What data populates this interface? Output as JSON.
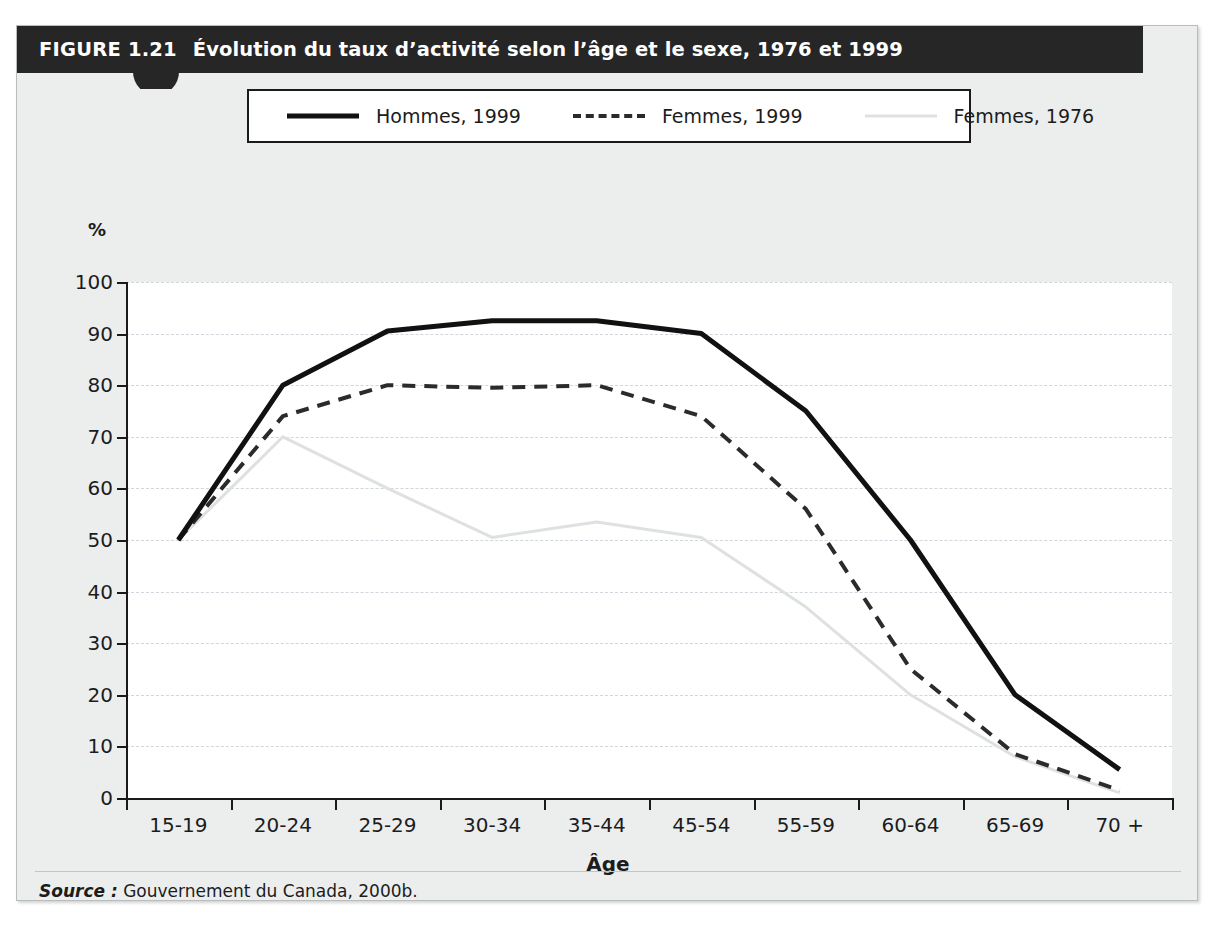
{
  "figure": {
    "number": "FIGURE 1.21",
    "title": "Évolution du taux d’activité selon l’âge et le sexe, 1976 et 1999",
    "source_label": "Source :",
    "source_text": "Gouvernement du Canada, 2000b.",
    "header_color": "#262626",
    "plate_color": "#eceeee"
  },
  "chart_data": {
    "type": "line",
    "title": "Évolution du taux d’activité selon l’âge et le sexe, 1976 et 1999",
    "xlabel": "Âge",
    "ylabel": "%",
    "ylim": [
      0,
      100
    ],
    "ytick_step": 10,
    "yticks": [
      "100",
      "90",
      "80",
      "70",
      "60",
      "50",
      "40",
      "30",
      "20",
      "10",
      "0"
    ],
    "grid": true,
    "legend_position": "top-center",
    "categories": [
      "15-19",
      "20-24",
      "25-29",
      "30-34",
      "35-44",
      "45-54",
      "55-59",
      "60-64",
      "65-69",
      "70 +"
    ],
    "series": [
      {
        "name": "Hommes, 1999",
        "style": "solid",
        "color": "#111111",
        "values": [
          50,
          80,
          90.5,
          92.5,
          92.5,
          90,
          75,
          50,
          20,
          5.5
        ]
      },
      {
        "name": "Femmes, 1999",
        "style": "dashed",
        "color": "#2b2b2b",
        "values": [
          50,
          74,
          80,
          79.5,
          80,
          74,
          56,
          25,
          8.5,
          1.5
        ]
      },
      {
        "name": "Femmes, 1976",
        "style": "light-solid",
        "color": "#dfe1e1",
        "values": [
          50,
          70,
          60,
          50.5,
          53.5,
          50.5,
          37,
          20,
          8,
          1
        ]
      }
    ]
  }
}
